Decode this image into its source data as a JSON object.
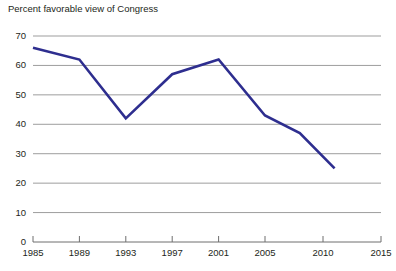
{
  "chart_data": {
    "type": "line",
    "title": "Percent favorable view of Congress",
    "xlabel": "",
    "ylabel": "",
    "ylim": [
      0,
      70
    ],
    "xlim": [
      1985,
      2015
    ],
    "yticks": [
      0,
      10,
      20,
      30,
      40,
      50,
      60,
      70
    ],
    "xticks": [
      1985,
      1989,
      1993,
      1997,
      2001,
      2005,
      2010,
      2015
    ],
    "ytick_labels": [
      "0",
      "10",
      "20",
      "30",
      "40",
      "50",
      "60",
      "70"
    ],
    "xtick_labels": [
      "1985",
      "1989",
      "1993",
      "1997",
      "2001",
      "2005",
      "2010",
      "2015"
    ],
    "grid": true,
    "grid_axis": "y",
    "legend": false,
    "series": [
      {
        "name": "Percent favorable view of Congress",
        "color": "#2e2e8f",
        "x": [
          1985,
          1989,
          1993,
          1997,
          2001,
          2005,
          2008,
          2011
        ],
        "values": [
          66,
          62,
          42,
          57,
          62,
          43,
          37,
          25
        ]
      }
    ]
  },
  "colors": {
    "line": "#2e2e8f",
    "grid": "#9d9d9d",
    "axis": "#6e6e6e",
    "text": "#231f20",
    "background": "#ffffff"
  }
}
